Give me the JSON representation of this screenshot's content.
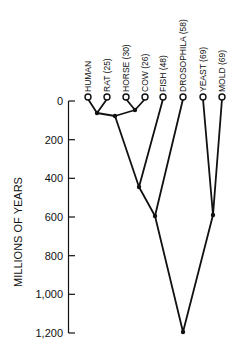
{
  "diagram": {
    "type": "phylogenetic-tree",
    "y_axis": {
      "title": "MILLIONS OF YEARS",
      "ticks": [
        "0",
        "200",
        "400",
        "600",
        "800",
        "1,000",
        "1,200"
      ],
      "tick_values": [
        0,
        200,
        400,
        600,
        800,
        1000,
        1200
      ]
    },
    "leaves": [
      {
        "id": "human",
        "label": "HUMAN"
      },
      {
        "id": "rat",
        "label": "RAT (25)"
      },
      {
        "id": "horse",
        "label": "HORSE (30)"
      },
      {
        "id": "cow",
        "label": "COW (26)"
      },
      {
        "id": "fish",
        "label": "FISH (48)"
      },
      {
        "id": "drosophila",
        "label": "DROSOPHILA (58)"
      },
      {
        "id": "yeast",
        "label": "YEAST (69)"
      },
      {
        "id": "mold",
        "label": "MOLD (69)"
      }
    ],
    "internal_nodes": [
      {
        "id": "human-rat",
        "age_my": 70
      },
      {
        "id": "horse-cow",
        "age_my": 55
      },
      {
        "id": "mammals",
        "age_my": 85
      },
      {
        "id": "vertebrates",
        "age_my": 450
      },
      {
        "id": "animals",
        "age_my": 600
      },
      {
        "id": "fungi",
        "age_my": 590
      },
      {
        "id": "root",
        "age_my": 1200
      }
    ]
  }
}
